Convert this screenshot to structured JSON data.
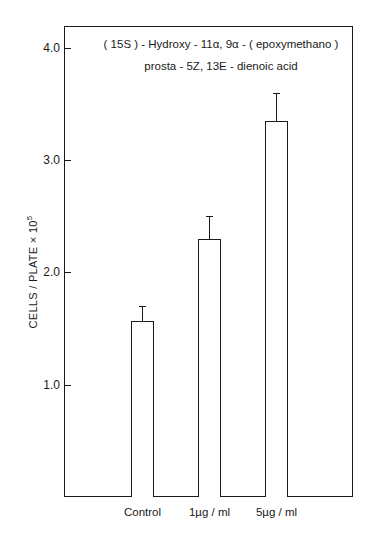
{
  "chart_data": {
    "type": "bar",
    "title_lines": [
      "( 15S ) - Hydroxy - 11α, 9α - ( epoxymethano )",
      "prosta - 5Z, 13E - dienoic acid"
    ],
    "categories": [
      "Control",
      "1µg / ml",
      "5µg / ml"
    ],
    "values": [
      1.57,
      2.3,
      3.35
    ],
    "error_upper": [
      1.7,
      2.5,
      3.6
    ],
    "xlabel": "",
    "ylabel": "CELLS / PLATE × 10",
    "ylabel_exponent": "5",
    "ylim": [
      0,
      4.2
    ],
    "yticks": [
      1.0,
      2.0,
      3.0,
      4.0
    ],
    "ytick_labels": [
      "1.0",
      "2.0",
      "3.0",
      "4.0"
    ],
    "grid": false,
    "legend": null
  }
}
